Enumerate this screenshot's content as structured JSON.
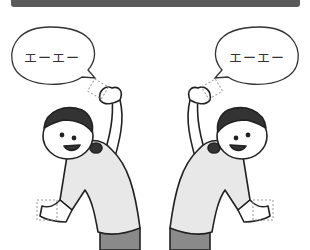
{
  "illustration": {
    "header_color": "#5a5a5a",
    "left_bubble": {
      "text": "エーエー"
    },
    "right_bubble": {
      "text": "エーエー"
    },
    "figures": [
      {
        "side": "left",
        "pose": "side-bend-right-arm-raised"
      },
      {
        "side": "right",
        "pose": "side-bend-left-arm-raised"
      }
    ],
    "colors": {
      "outline": "#222222",
      "shirt": "#e8e8e8",
      "pants": "#8a8a8a",
      "hair": "#333333",
      "dashed_box": "#999999"
    }
  }
}
